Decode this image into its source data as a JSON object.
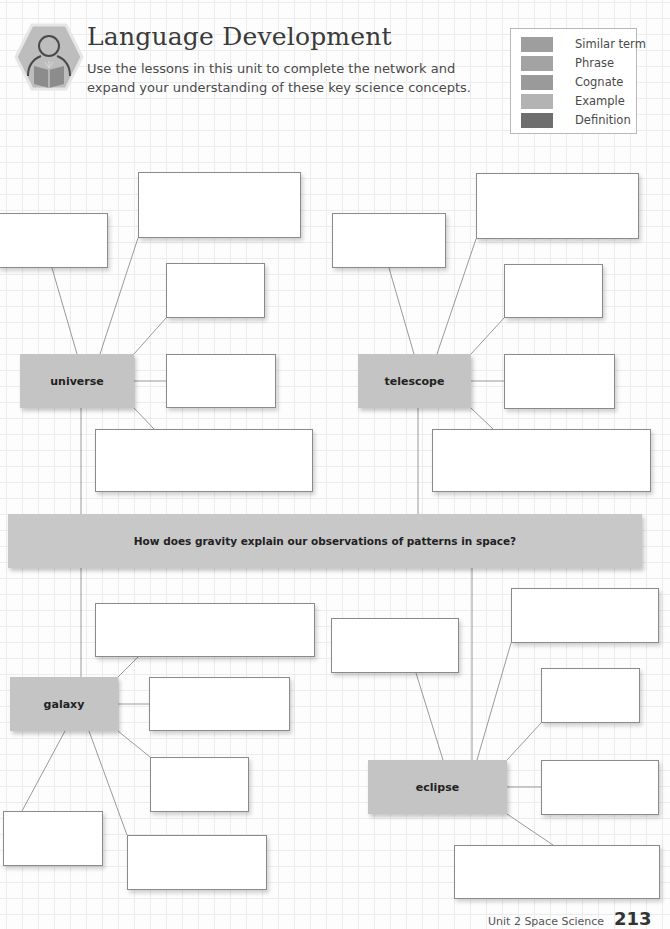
{
  "header": {
    "icon": "reader-book-hexagon-icon",
    "title": "Language Development",
    "subtitle": "Use the lessons in this unit to complete the network and expand your understanding of these key science concepts."
  },
  "legend": {
    "items": [
      {
        "label": "Similar term",
        "color": "#9e9e9e"
      },
      {
        "label": "Phrase",
        "color": "#a3a3a3"
      },
      {
        "label": "Cognate",
        "color": "#9a9a9a"
      },
      {
        "label": "Example",
        "color": "#b3b3b3"
      },
      {
        "label": "Definition",
        "color": "#6e6e6e"
      }
    ]
  },
  "network": {
    "question": "How does gravity explain our observations of patterns in space?",
    "terms": {
      "universe": "universe",
      "telescope": "telescope",
      "galaxy": "galaxy",
      "eclipse": "eclipse"
    }
  },
  "footer": {
    "unit": "Unit 2 Space Science",
    "page": "213"
  }
}
